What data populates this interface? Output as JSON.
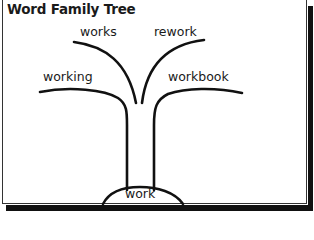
{
  "title": "Word Family Tree",
  "root": {
    "word": "work"
  },
  "branches": [
    {
      "word": "works",
      "side": "left",
      "level": "upper"
    },
    {
      "word": "rework",
      "side": "right",
      "level": "upper"
    },
    {
      "word": "working",
      "side": "left",
      "level": "lower"
    },
    {
      "word": "workbook",
      "side": "right",
      "level": "lower"
    }
  ],
  "colors": {
    "line": "#111111",
    "text": "#1a1a1a",
    "background": "#ffffff",
    "shadow": "#111111"
  }
}
